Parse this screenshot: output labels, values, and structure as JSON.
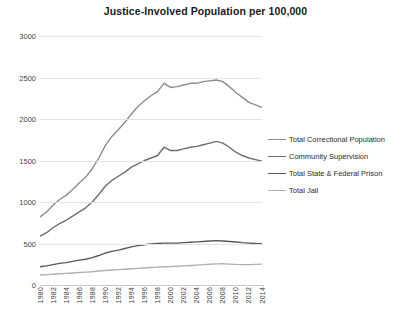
{
  "chart_data": {
    "type": "line",
    "title": "Justice-Involved Population per 100,000",
    "xlabel": "",
    "ylabel": "",
    "ylim": [
      0,
      3000
    ],
    "yticks": [
      0,
      500,
      1000,
      1500,
      2000,
      2500,
      3000
    ],
    "ytick_labels": [
      "0",
      "500",
      "1000",
      "1500",
      "2000",
      "2500",
      "3000"
    ],
    "grid": true,
    "legend_position": "right",
    "x": [
      1980,
      1981,
      1982,
      1983,
      1984,
      1985,
      1986,
      1987,
      1988,
      1989,
      1990,
      1991,
      1992,
      1993,
      1994,
      1995,
      1996,
      1997,
      1998,
      1999,
      2000,
      2001,
      2002,
      2003,
      2004,
      2005,
      2006,
      2007,
      2008,
      2009,
      2010,
      2011,
      2012,
      2013,
      2014
    ],
    "xtick_labels": [
      "1980",
      "1982",
      "1984",
      "1986",
      "1988",
      "1990",
      "1992",
      "1994",
      "1996",
      "1998",
      "2000",
      "2002",
      "2004",
      "2006",
      "2008",
      "2010",
      "2012",
      "2014"
    ],
    "series": [
      {
        "name": "Total Correctional Population",
        "color": "#8c8c8c",
        "values": [
          820,
          880,
          960,
          1030,
          1080,
          1150,
          1230,
          1300,
          1400,
          1530,
          1680,
          1790,
          1870,
          1960,
          2060,
          2150,
          2220,
          2280,
          2330,
          2430,
          2380,
          2390,
          2410,
          2430,
          2430,
          2450,
          2460,
          2470,
          2450,
          2390,
          2320,
          2260,
          2200,
          2170,
          2140
        ]
      },
      {
        "name": "Community Supervision",
        "color": "#6e6e6e",
        "values": [
          590,
          630,
          690,
          740,
          780,
          830,
          880,
          930,
          1000,
          1090,
          1190,
          1260,
          1310,
          1360,
          1420,
          1460,
          1500,
          1530,
          1560,
          1660,
          1620,
          1620,
          1640,
          1660,
          1670,
          1690,
          1710,
          1730,
          1710,
          1660,
          1600,
          1560,
          1530,
          1510,
          1490
        ]
      },
      {
        "name": "Total State & Federal Prison",
        "color": "#5a5a5a",
        "values": [
          220,
          230,
          245,
          260,
          270,
          285,
          300,
          310,
          330,
          355,
          385,
          405,
          420,
          440,
          460,
          475,
          485,
          495,
          500,
          505,
          505,
          505,
          510,
          515,
          520,
          525,
          530,
          535,
          530,
          525,
          518,
          510,
          505,
          500,
          498
        ]
      },
      {
        "name": "Total Jail",
        "color": "#b0b0b0",
        "values": [
          120,
          125,
          130,
          135,
          140,
          145,
          150,
          155,
          160,
          168,
          175,
          180,
          185,
          190,
          195,
          200,
          205,
          210,
          215,
          220,
          222,
          226,
          230,
          235,
          240,
          245,
          250,
          255,
          256,
          252,
          248,
          246,
          245,
          248,
          252
        ]
      }
    ]
  },
  "legend": {
    "items": [
      {
        "label": "Total Correctional Population"
      },
      {
        "label": "Community Supervision"
      },
      {
        "label": "Total State & Federal Prison"
      },
      {
        "label": "Total Jail"
      }
    ]
  }
}
